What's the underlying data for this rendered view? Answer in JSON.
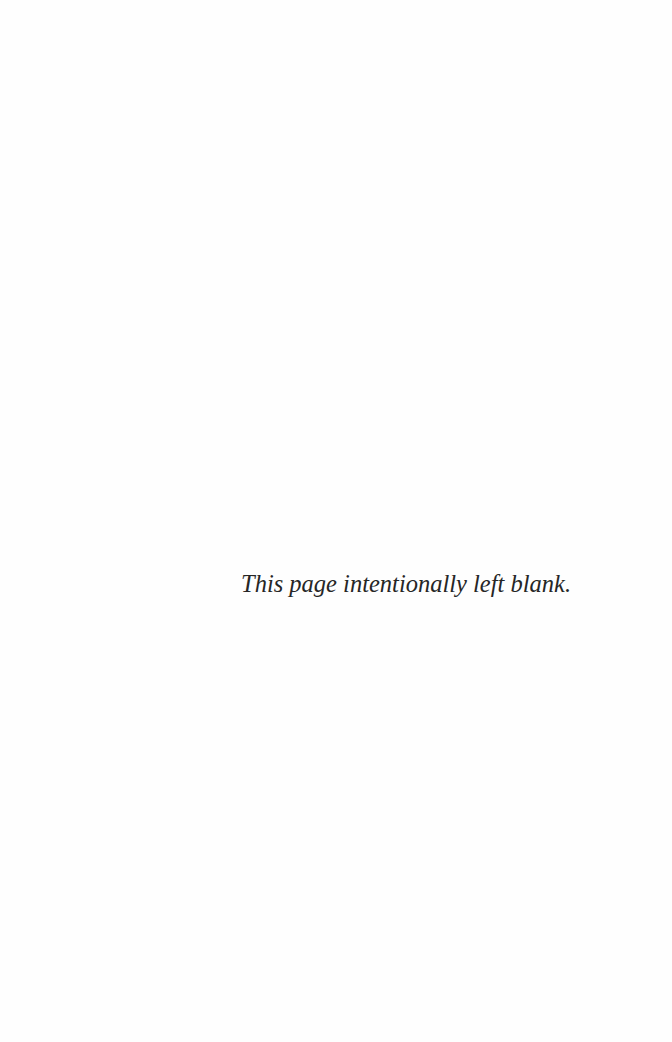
{
  "page": {
    "notice": "This page intentionally left blank.",
    "background_color": "#fefefe",
    "text_color": "#262626"
  }
}
